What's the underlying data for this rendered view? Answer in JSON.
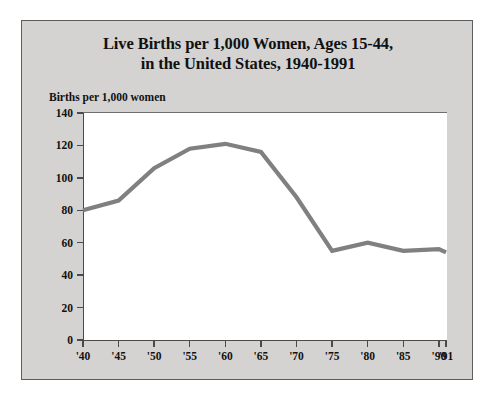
{
  "figure": {
    "background_color": "#ffffff",
    "panel_color": "#d4d3d1",
    "panel_border_color": "#5d5d5d",
    "plot_background_color": "#ffffff",
    "axis_color": "#4a4a4a",
    "line_color": "#808080"
  },
  "title": {
    "line1": "Live Births per 1,000 Women, Ages 15-44,",
    "line2": "in the United States, 1940-1991"
  },
  "axis_caption": "Births per 1,000 women",
  "chart_data": {
    "type": "line",
    "title": "Live Births per 1,000 Women, Ages 15-44, in the United States, 1940-1991",
    "xlabel": "",
    "ylabel": "Births per 1,000 women",
    "categories": [
      "'40",
      "'45",
      "'50",
      "'55",
      "'60",
      "'65",
      "'70",
      "'75",
      "'80",
      "'85",
      "'90",
      "'91"
    ],
    "x_values": [
      1940,
      1945,
      1950,
      1955,
      1960,
      1965,
      1970,
      1975,
      1980,
      1985,
      1990,
      1991
    ],
    "values": [
      80,
      86,
      106,
      118,
      121,
      116,
      88,
      55,
      60,
      55,
      56,
      54
    ],
    "series": [
      {
        "name": "Live births per 1,000 women ages 15-44",
        "values": [
          80,
          86,
          106,
          118,
          121,
          116,
          88,
          55,
          60,
          55,
          56,
          54
        ],
        "color": "#808080"
      }
    ],
    "ylim": [
      0,
      140
    ],
    "y_ticks": [
      0,
      20,
      40,
      60,
      80,
      100,
      120,
      140
    ],
    "y_tick_labels": [
      "0",
      "20",
      "40",
      "60",
      "80",
      "100",
      "120",
      "140"
    ],
    "xlim": [
      1940,
      1991
    ],
    "x_ticks": [
      1940,
      1945,
      1950,
      1955,
      1960,
      1965,
      1970,
      1975,
      1980,
      1985,
      1990,
      1991
    ],
    "x_tick_labels": [
      "'40",
      "'45",
      "'50",
      "'55",
      "'60",
      "'65",
      "'70",
      "'75",
      "'80",
      "'85",
      "'90",
      "'91"
    ],
    "grid": false,
    "legend": null,
    "legend_position": "none",
    "annotations": []
  }
}
